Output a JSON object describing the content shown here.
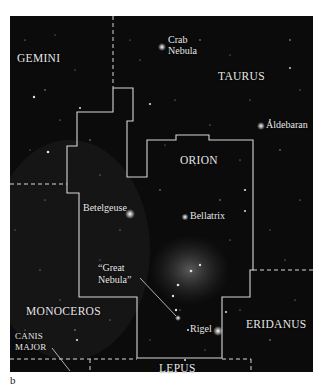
{
  "figure": {
    "panel_label": "b",
    "background_color": "#0b0b0b",
    "boundary_color": "#d8d8d8"
  },
  "constellations": {
    "gemini": "GEMINI",
    "taurus": "TAURUS",
    "orion": "ORION",
    "monoceros": "MONOCEROS",
    "canis_major_line1": "CANIS",
    "canis_major_line2": "MAJOR",
    "eridanus": "ERIDANUS",
    "lepus": "LEPUS"
  },
  "objects": {
    "crab_nebula_line1": "Crab",
    "crab_nebula_line2": "Nebula",
    "aldebaran": "Aldebaran",
    "betelgeuse": "Betelgeuse",
    "bellatrix": "Bellatrix",
    "great_nebula_line1": "“Great",
    "great_nebula_line2": "Nebula”",
    "rigel": "Rigel"
  }
}
